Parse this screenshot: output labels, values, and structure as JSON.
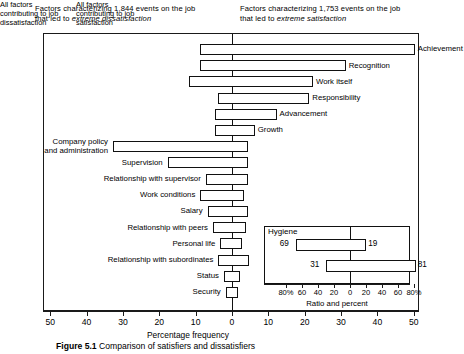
{
  "headers": {
    "left_line1": "Factors characterizing 1,844 events on the job",
    "left_line2_prefix": "that led to ",
    "left_line2_italic": "extreme dissatisfaction",
    "right_line1": "Factors characterizing 1,753 events on the job",
    "right_line2_prefix": "that led to ",
    "right_line2_italic": "extreme satisfaction"
  },
  "axis": {
    "title": "Percentage frequency",
    "tick_labels": [
      "50",
      "40",
      "30",
      "20",
      "10",
      "0",
      "10",
      "20",
      "30",
      "40",
      "50"
    ],
    "tick_values": [
      -50,
      -40,
      -30,
      -20,
      -10,
      0,
      10,
      20,
      30,
      40,
      50
    ]
  },
  "inset": {
    "head_left": "All factors contributing to job dissatisfaction",
    "head_right": "All factors contributing to job satisfaction",
    "series_label": "Hygiene",
    "title": "Ratio and percent",
    "tick_labels": [
      "80%",
      "60",
      "40",
      "20",
      "0",
      "20",
      "40",
      "60",
      "80%"
    ],
    "tick_values": [
      -80,
      -60,
      -40,
      -20,
      0,
      20,
      40,
      60,
      80
    ],
    "rows": [
      {
        "left": 69,
        "right": 19
      },
      {
        "left": 31,
        "right": 81
      }
    ]
  },
  "chart_data": {
    "type": "bar",
    "xlabel": "Percentage frequency",
    "ylabel": "",
    "xlim": [
      -55,
      55
    ],
    "grid": false,
    "legend": "none",
    "orientation": "horizontal",
    "note": "Each factor bar spans from its dissatisfaction frequency (left of zero, negative) to its satisfaction frequency (right of zero, positive).",
    "categories": [
      "Achievement",
      "Recognition",
      "Work itself",
      "Responsibility",
      "Advancement",
      "Growth",
      "Company policy and administration",
      "Supervision",
      "Relationship with supervisor",
      "Work conditions",
      "Salary",
      "Relationship with peers",
      "Personal life",
      "Relationship with subordinates",
      "Status",
      "Security"
    ],
    "series": [
      {
        "name": "Dissatisfaction frequency (left of zero)",
        "values": [
          9,
          9,
          12,
          4,
          5,
          5,
          33,
          18,
          7.5,
          9,
          7,
          5.5,
          3.5,
          4,
          2.5,
          2
        ]
      },
      {
        "name": "Satisfaction frequency (right of zero)",
        "values": [
          50,
          31,
          22,
          21,
          12,
          6,
          4,
          4,
          4,
          3,
          4,
          3.5,
          2.5,
          4.5,
          2,
          1.5
        ]
      }
    ],
    "inset": {
      "type": "bar",
      "title": "Ratio and percent",
      "xlim": [
        -100,
        100
      ],
      "categories": [
        "Hygiene",
        "Motivators"
      ],
      "series": [
        {
          "name": "Contributing to job dissatisfaction",
          "values": [
            69,
            31
          ]
        },
        {
          "name": "Contributing to job satisfaction",
          "values": [
            19,
            81
          ]
        }
      ]
    }
  },
  "figure": {
    "caption_label": "Figure 5.1",
    "caption_text": "Comparison of satisfiers and dissatisfiers"
  }
}
